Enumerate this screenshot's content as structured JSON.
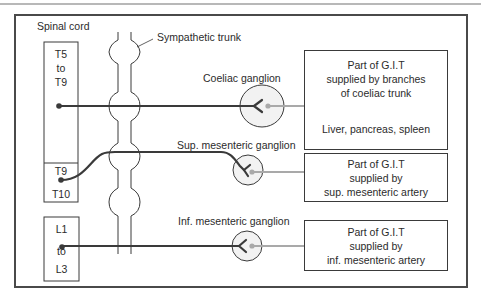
{
  "diagram": {
    "labels": {
      "spinal_cord": "Spinal cord",
      "sympathetic_trunk": "Sympathetic trunk",
      "coeliac_ganglion": "Coeliac ganglion",
      "sup_mesenteric_ganglion": "Sup. mesenteric ganglion",
      "inf_mesenteric_ganglion": "Inf. mesenteric ganglion"
    },
    "cord_segments": {
      "upper": {
        "line1": "T5",
        "line2": "to",
        "line3": "T9"
      },
      "middle": {
        "top": "T9",
        "bottom": "T10"
      },
      "lower": {
        "line1": "L1",
        "line2": "to",
        "line3": "L3"
      }
    },
    "targets": {
      "coeliac": {
        "line1": "Part of G.I.T",
        "line2": "supplied by branches",
        "line3": "of coeliac trunk",
        "organs": "Liver, pancreas, spleen"
      },
      "sup_mesenteric": {
        "line1": "Part of G.I.T",
        "line2": "supplied by",
        "line3": "sup. mesenteric artery"
      },
      "inf_mesenteric": {
        "line1": "Part of G.I.T",
        "line2": "supplied by",
        "line3": "inf. mesenteric artery"
      }
    },
    "colors": {
      "preganglionic": "#3a3a3a",
      "postganglionic": "#a9a9a9",
      "ganglion_fill": "#f2f2f2",
      "frame": "#4a4a4a"
    }
  }
}
